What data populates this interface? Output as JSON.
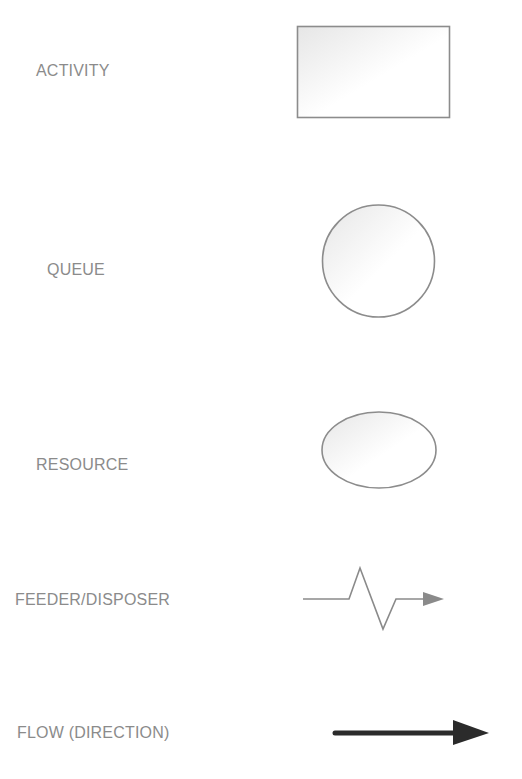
{
  "diagram": {
    "type": "legend",
    "items": [
      {
        "label": "ACTIVITY",
        "symbol": "rectangle"
      },
      {
        "label": "QUEUE",
        "symbol": "circle"
      },
      {
        "label": "RESOURCE",
        "symbol": "ellipse"
      },
      {
        "label": "FEEDER/DISPOSER",
        "symbol": "zigzag-arrow"
      },
      {
        "label": "FLOW (DIRECTION)",
        "symbol": "thick-arrow"
      }
    ]
  },
  "colors": {
    "label_text": "#8b8b8b",
    "shape_stroke": "#8c8c8c",
    "shape_fill_start": "#e9e9e9",
    "shape_fill_end": "#ffffff",
    "feeder_stroke": "#8a8a8a",
    "flow_arrow": "#2b2b2b"
  }
}
